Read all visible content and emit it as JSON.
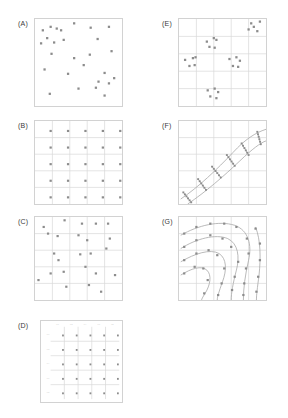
{
  "figure": {
    "panels": [
      {
        "id": "A",
        "label": "(A)",
        "design": "simple-random",
        "grid": false,
        "points": [
          [
            0.09,
            0.13
          ],
          [
            0.18,
            0.09
          ],
          [
            0.25,
            0.11
          ],
          [
            0.3,
            0.13
          ],
          [
            0.45,
            0.05
          ],
          [
            0.64,
            0.1
          ],
          [
            0.85,
            0.09
          ],
          [
            0.14,
            0.22
          ],
          [
            0.22,
            0.27
          ],
          [
            0.33,
            0.24
          ],
          [
            0.07,
            0.28
          ],
          [
            0.72,
            0.23
          ],
          [
            0.19,
            0.4
          ],
          [
            0.45,
            0.45
          ],
          [
            0.63,
            0.41
          ],
          [
            0.88,
            0.37
          ],
          [
            0.56,
            0.53
          ],
          [
            0.11,
            0.58
          ],
          [
            0.38,
            0.63
          ],
          [
            0.8,
            0.62
          ],
          [
            0.91,
            0.68
          ],
          [
            0.73,
            0.72
          ],
          [
            0.85,
            0.74
          ],
          [
            0.5,
            0.8
          ],
          [
            0.7,
            0.79
          ],
          [
            0.17,
            0.86
          ],
          [
            0.8,
            0.88
          ]
        ]
      },
      {
        "id": "B",
        "label": "(B)",
        "design": "systematic-regular",
        "grid": true,
        "points": [
          [
            0.18,
            0.12
          ],
          [
            0.38,
            0.12
          ],
          [
            0.58,
            0.12
          ],
          [
            0.78,
            0.12
          ],
          [
            0.98,
            0.12
          ],
          [
            0.18,
            0.32
          ],
          [
            0.38,
            0.32
          ],
          [
            0.58,
            0.32
          ],
          [
            0.78,
            0.32
          ],
          [
            0.98,
            0.32
          ],
          [
            0.18,
            0.52
          ],
          [
            0.38,
            0.52
          ],
          [
            0.58,
            0.52
          ],
          [
            0.78,
            0.52
          ],
          [
            0.98,
            0.52
          ],
          [
            0.18,
            0.72
          ],
          [
            0.38,
            0.72
          ],
          [
            0.58,
            0.72
          ],
          [
            0.78,
            0.72
          ],
          [
            0.98,
            0.72
          ],
          [
            0.18,
            0.92
          ],
          [
            0.38,
            0.92
          ],
          [
            0.58,
            0.92
          ],
          [
            0.78,
            0.92
          ],
          [
            0.98,
            0.92
          ]
        ]
      },
      {
        "id": "C",
        "label": "(C)",
        "design": "stratified-random",
        "grid": true,
        "points": [
          [
            0.1,
            0.12
          ],
          [
            0.34,
            0.04
          ],
          [
            0.54,
            0.08
          ],
          [
            0.7,
            0.08
          ],
          [
            0.84,
            0.08
          ],
          [
            0.15,
            0.2
          ],
          [
            0.26,
            0.23
          ],
          [
            0.5,
            0.22
          ],
          [
            0.6,
            0.28
          ],
          [
            0.86,
            0.26
          ],
          [
            0.22,
            0.44
          ],
          [
            0.27,
            0.52
          ],
          [
            0.52,
            0.45
          ],
          [
            0.64,
            0.44
          ],
          [
            0.82,
            0.38
          ],
          [
            0.18,
            0.68
          ],
          [
            0.33,
            0.66
          ],
          [
            0.58,
            0.6
          ],
          [
            0.7,
            0.68
          ],
          [
            0.92,
            0.7
          ],
          [
            0.04,
            0.76
          ],
          [
            0.36,
            0.84
          ],
          [
            0.62,
            0.82
          ],
          [
            0.76,
            0.9
          ]
        ]
      },
      {
        "id": "D",
        "label": "(D)",
        "design": "systematic-with-axes",
        "grid": true,
        "axes": true,
        "x_ticks": [
          "0.0",
          "0.2",
          "0.4",
          "0.6",
          "0.8"
        ],
        "y_ticks": [
          "0.0",
          "0.2",
          "0.4",
          "0.6",
          "0.8"
        ],
        "points": [
          [
            0.18,
            0.12
          ],
          [
            0.38,
            0.12
          ],
          [
            0.58,
            0.12
          ],
          [
            0.78,
            0.12
          ],
          [
            0.98,
            0.12
          ],
          [
            0.18,
            0.32
          ],
          [
            0.38,
            0.32
          ],
          [
            0.58,
            0.32
          ],
          [
            0.78,
            0.32
          ],
          [
            0.98,
            0.32
          ],
          [
            0.18,
            0.52
          ],
          [
            0.38,
            0.52
          ],
          [
            0.58,
            0.52
          ],
          [
            0.78,
            0.52
          ],
          [
            0.98,
            0.52
          ],
          [
            0.18,
            0.72
          ],
          [
            0.38,
            0.72
          ],
          [
            0.58,
            0.72
          ],
          [
            0.78,
            0.72
          ],
          [
            0.98,
            0.72
          ],
          [
            0.18,
            0.92
          ],
          [
            0.38,
            0.92
          ],
          [
            0.58,
            0.92
          ],
          [
            0.78,
            0.92
          ],
          [
            0.98,
            0.92
          ]
        ]
      },
      {
        "id": "E",
        "label": "(E)",
        "design": "cluster",
        "grid": true,
        "points": [
          [
            0.83,
            0.05
          ],
          [
            0.93,
            0.03
          ],
          [
            0.8,
            0.12
          ],
          [
            0.9,
            0.14
          ],
          [
            0.86,
            0.09
          ],
          [
            0.32,
            0.26
          ],
          [
            0.4,
            0.22
          ],
          [
            0.43,
            0.24
          ],
          [
            0.35,
            0.32
          ],
          [
            0.41,
            0.33
          ],
          [
            0.07,
            0.47
          ],
          [
            0.16,
            0.45
          ],
          [
            0.19,
            0.44
          ],
          [
            0.12,
            0.54
          ],
          [
            0.18,
            0.53
          ],
          [
            0.58,
            0.46
          ],
          [
            0.66,
            0.44
          ],
          [
            0.7,
            0.48
          ],
          [
            0.62,
            0.54
          ],
          [
            0.68,
            0.55
          ],
          [
            0.33,
            0.82
          ],
          [
            0.41,
            0.8
          ],
          [
            0.45,
            0.84
          ],
          [
            0.36,
            0.89
          ],
          [
            0.43,
            0.91
          ]
        ]
      },
      {
        "id": "F",
        "label": "(F)",
        "design": "transect",
        "grid": true,
        "curves": [
          "M 0.02 0.94 C 0.22 0.80 0.44 0.58 0.62 0.38 C 0.76 0.22 0.88 0.14 1.00 0.10",
          "M 0.10 1.00 C 0.30 0.86 0.52 0.66 0.70 0.48 C 0.84 0.34 0.94 0.26 1.00 0.24"
        ],
        "transects": [
          {
            "x1": 0.05,
            "y1": 0.86,
            "x2": 0.14,
            "y2": 0.98
          },
          {
            "x1": 0.22,
            "y1": 0.7,
            "x2": 0.31,
            "y2": 0.83
          },
          {
            "x1": 0.38,
            "y1": 0.55,
            "x2": 0.48,
            "y2": 0.68
          },
          {
            "x1": 0.55,
            "y1": 0.41,
            "x2": 0.64,
            "y2": 0.54
          },
          {
            "x1": 0.72,
            "y1": 0.27,
            "x2": 0.8,
            "y2": 0.41
          },
          {
            "x1": 0.9,
            "y1": 0.13,
            "x2": 0.94,
            "y2": 0.28
          }
        ],
        "points_per_transect": 6
      },
      {
        "id": "G",
        "label": "(G)",
        "design": "contour-following",
        "grid": true,
        "curves": [
          "M 0.02 0.22 C 0.22 0.10 0.46 0.04 0.64 0.10 C 0.80 0.16 0.84 0.34 0.80 0.52 C 0.76 0.70 0.74 0.86 0.74 1.00",
          "M 0.02 0.38 C 0.20 0.26 0.42 0.20 0.56 0.26 C 0.68 0.32 0.70 0.48 0.66 0.64 C 0.62 0.80 0.60 0.92 0.60 1.00",
          "M 0.02 0.54 C 0.18 0.44 0.36 0.38 0.46 0.44 C 0.55 0.50 0.55 0.64 0.50 0.78 C 0.46 0.90 0.44 0.96 0.44 1.00",
          "M 0.02 0.70 C 0.14 0.62 0.26 0.58 0.32 0.64 C 0.38 0.70 0.36 0.82 0.30 0.92 C 0.27 0.97 0.26 0.99 0.26 1.00",
          "M 0.88 0.12 C 0.94 0.28 0.94 0.50 0.92 0.70 C 0.90 0.86 0.89 0.94 0.89 1.00"
        ],
        "points": [
          [
            0.06,
            0.2
          ],
          [
            0.2,
            0.12
          ],
          [
            0.36,
            0.08
          ],
          [
            0.52,
            0.08
          ],
          [
            0.66,
            0.12
          ],
          [
            0.78,
            0.26
          ],
          [
            0.8,
            0.44
          ],
          [
            0.77,
            0.62
          ],
          [
            0.75,
            0.8
          ],
          [
            0.74,
            0.94
          ],
          [
            0.06,
            0.36
          ],
          [
            0.2,
            0.28
          ],
          [
            0.36,
            0.22
          ],
          [
            0.5,
            0.26
          ],
          [
            0.6,
            0.36
          ],
          [
            0.68,
            0.54
          ],
          [
            0.64,
            0.72
          ],
          [
            0.61,
            0.88
          ],
          [
            0.06,
            0.52
          ],
          [
            0.2,
            0.44
          ],
          [
            0.34,
            0.4
          ],
          [
            0.44,
            0.46
          ],
          [
            0.52,
            0.62
          ],
          [
            0.49,
            0.8
          ],
          [
            0.45,
            0.94
          ],
          [
            0.06,
            0.68
          ],
          [
            0.18,
            0.6
          ],
          [
            0.28,
            0.62
          ],
          [
            0.33,
            0.76
          ],
          [
            0.29,
            0.92
          ],
          [
            0.88,
            0.14
          ],
          [
            0.93,
            0.32
          ],
          [
            0.93,
            0.52
          ],
          [
            0.91,
            0.72
          ],
          [
            0.89,
            0.9
          ]
        ]
      }
    ]
  },
  "style": {
    "point_color": "#8c8c8c",
    "grid_color": "#d8d8d8",
    "frame_color": "#d2d2d2",
    "curve_color": "#a8a8a8",
    "label_color": "#3a3a3a",
    "tick_color": "#c6c6c6"
  }
}
